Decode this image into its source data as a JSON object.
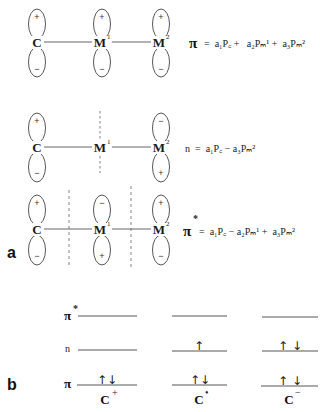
{
  "panel_a": {
    "label": "a",
    "atoms": {
      "c": "C",
      "m1": "M",
      "m1_sup": "1",
      "m2": "M",
      "m2_sup": "2"
    },
    "rows": [
      {
        "name": "pi",
        "lobes": {
          "c": [
            "+",
            "−"
          ],
          "m1": [
            "+",
            "−"
          ],
          "m2": [
            "+",
            "−"
          ]
        },
        "nodes": [],
        "equation": {
          "symbol": "π",
          "star": "",
          "rhs": "=  a₁P꜀ +   a₂Pₘ¹ +  a₃Pₘ²"
        }
      },
      {
        "name": "n",
        "lobes": {
          "c": [
            "+",
            "−"
          ],
          "m1": [],
          "m2": [
            "−",
            "+"
          ]
        },
        "nodes": [
          "through M1"
        ],
        "equation": {
          "symbol": "n",
          "star": "",
          "rhs": "=  a₁P꜀ − a₃Pₘ²"
        }
      },
      {
        "name": "pi-star",
        "lobes": {
          "c": [
            "+",
            "−"
          ],
          "m1": [
            "−",
            "+"
          ],
          "m2": [
            "+",
            "−"
          ]
        },
        "nodes": [
          "between C and M1",
          "between M1 and M2"
        ],
        "equation": {
          "symbol": "π",
          "star": "*",
          "rhs": "=  a₁P꜀ − a₂Pₘ¹ +  a₃Pₘ²"
        }
      }
    ]
  },
  "panel_b": {
    "label": "b",
    "levels": [
      {
        "symbol": "π",
        "star": "*"
      },
      {
        "symbol": "n",
        "star": ""
      },
      {
        "symbol": "π",
        "star": ""
      }
    ],
    "species": [
      {
        "label": "C",
        "charge": "+",
        "pi_star": "",
        "n": "",
        "pi": "↑↓"
      },
      {
        "label": "C",
        "charge": "•",
        "pi_star": "",
        "n": "↑",
        "pi": "↑↓"
      },
      {
        "label": "C",
        "charge": "−",
        "pi_star": "",
        "n": "↑ ↓",
        "pi": "↑ ↓"
      }
    ]
  }
}
